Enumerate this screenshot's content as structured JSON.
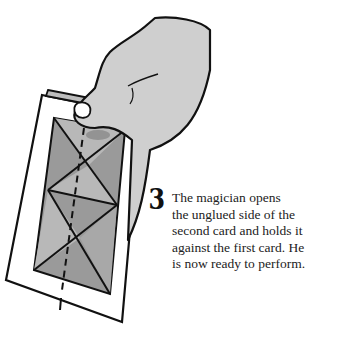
{
  "illustration": {
    "description": "Hand holding a card with a geometric pattern",
    "colors": {
      "hand": "#cfcfcf",
      "card_face": "#ffffff",
      "pattern_dark": "#8a8a8a",
      "pattern_light": "#b4b4b4",
      "outline": "#111111"
    }
  },
  "step": {
    "number": "3",
    "lines": [
      "The magician opens",
      "the unglued side of the",
      "second card and holds it",
      "against the first card. He",
      "is now ready to perform."
    ]
  }
}
